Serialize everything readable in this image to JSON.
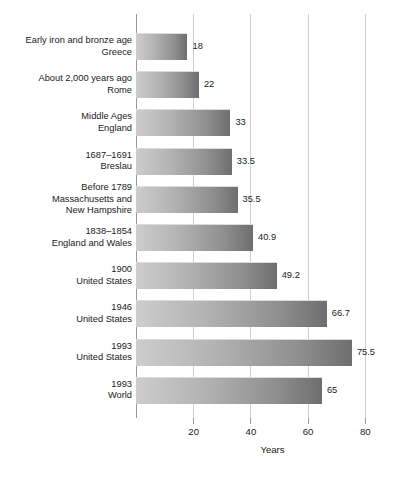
{
  "chart_data": {
    "type": "bar",
    "orientation": "horizontal",
    "title": "",
    "xlabel": "Years",
    "ylabel": "",
    "xlim": [
      0,
      82.5
    ],
    "xticks": [
      20,
      40,
      60,
      80
    ],
    "xtick_labels": [
      "20",
      "40",
      "60",
      "80"
    ],
    "grid": true,
    "legend": false,
    "categories": [
      "Early iron and bronze age\nGreece",
      "About 2,000 years ago\nRome",
      "Middle Ages\nEngland",
      "1687–1691\nBreslau",
      "Before 1789\nMassachusetts and\nNew Hampshire",
      "1838–1854\nEngland and Wales",
      "1900\nUnited States",
      "1946\nUnited States",
      "1993\nUnited States",
      "1993\nWorld"
    ],
    "values": [
      18,
      22,
      33,
      33.5,
      35.5,
      40.9,
      49.2,
      66.7,
      75.5,
      65
    ],
    "value_labels": [
      "18",
      "22",
      "33",
      "33.5",
      "35.5",
      "40.9",
      "49.2",
      "66.7",
      "75.5",
      "65"
    ],
    "bar_color_start": "#cdcdcd",
    "bar_color_end": "#6e6e6e",
    "gridline_color": "#cfcfcf",
    "axis_color": "#9a9a9a",
    "background_color": "#ffffff"
  },
  "rows": [
    {
      "label": "Early iron and bronze age\nGreece",
      "value": 18,
      "value_label": "18"
    },
    {
      "label": "About 2,000 years ago\nRome",
      "value": 22,
      "value_label": "22"
    },
    {
      "label": "Middle Ages\nEngland",
      "value": 33,
      "value_label": "33"
    },
    {
      "label": "1687–1691\nBreslau",
      "value": 33.5,
      "value_label": "33.5"
    },
    {
      "label": "Before 1789\nMassachusetts and\nNew Hampshire",
      "value": 35.5,
      "value_label": "35.5"
    },
    {
      "label": "1838–1854\nEngland and Wales",
      "value": 40.9,
      "value_label": "40.9"
    },
    {
      "label": "1900\nUnited States",
      "value": 49.2,
      "value_label": "49.2"
    },
    {
      "label": "1946\nUnited States",
      "value": 66.7,
      "value_label": "66.7"
    },
    {
      "label": "1993\nUnited States",
      "value": 75.5,
      "value_label": "75.5"
    },
    {
      "label": "1993\nWorld",
      "value": 65,
      "value_label": "65"
    }
  ],
  "axis": {
    "title": "Years",
    "ticks": [
      "20",
      "40",
      "60",
      "80"
    ]
  }
}
